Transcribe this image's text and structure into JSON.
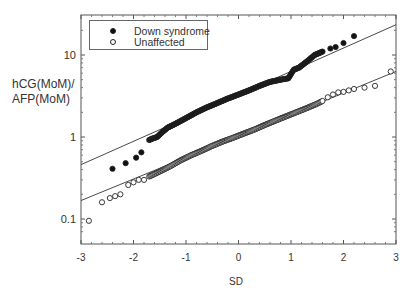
{
  "chart_data": {
    "type": "scatter",
    "title": "",
    "xlabel": "SD",
    "ylabel": "hCG(MoM)/ AFP(MoM)",
    "ylabel_lines": [
      "hCG(MoM)/",
      "AFP(MoM)"
    ],
    "xlim": [
      -3,
      3
    ],
    "ylim": [
      0.065,
      25
    ],
    "yscale": "log",
    "x_ticks": [
      -3,
      -2,
      -1,
      0,
      1,
      2,
      3
    ],
    "x_tick_labels": [
      "-3",
      "-2",
      "-1",
      "0",
      "1",
      "2",
      "3"
    ],
    "y_ticks": [
      0.1,
      1,
      10
    ],
    "y_tick_labels": [
      "0.1",
      "1",
      "10"
    ],
    "grid": false,
    "legend_position": "upper left",
    "legend": [
      {
        "label": "Down syndrome",
        "marker": "filled-circle"
      },
      {
        "label": "Unaffected",
        "marker": "open-circle"
      }
    ],
    "series": [
      {
        "name": "Down syndrome",
        "marker": "filled-circle",
        "fit_line": {
          "x": [
            -3,
            3
          ],
          "y": [
            0.46,
            23.4
          ]
        },
        "points": {
          "x": [
            -2.4,
            -2.15,
            -1.95,
            -1.85,
            -1.7,
            -1.65,
            -1.55,
            -1.45,
            -1.35,
            -1.2,
            -1.0,
            -0.8,
            -0.6,
            -0.4,
            -0.2,
            0.0,
            0.2,
            0.4,
            0.6,
            0.8,
            0.95,
            1.05,
            1.15,
            1.3,
            1.45,
            1.6,
            1.75,
            1.85,
            2.0,
            2.2
          ],
          "y": [
            0.41,
            0.48,
            0.56,
            0.65,
            0.92,
            0.95,
            1.0,
            1.15,
            1.3,
            1.45,
            1.7,
            2.0,
            2.3,
            2.6,
            2.95,
            3.3,
            3.7,
            4.2,
            4.7,
            5.0,
            5.2,
            6.6,
            7.0,
            8.3,
            10.0,
            11.0,
            12.0,
            12.5,
            14.0,
            17.0
          ]
        }
      },
      {
        "name": "Unaffected",
        "marker": "open-circle",
        "fit_line": {
          "x": [
            -3,
            3
          ],
          "y": [
            0.168,
            6.3
          ]
        },
        "points": {
          "x": [
            -2.85,
            -2.6,
            -2.45,
            -2.35,
            -2.25,
            -2.1,
            -2.0,
            -1.9,
            -1.8,
            -1.7,
            -1.5,
            -1.3,
            -1.1,
            -0.9,
            -0.7,
            -0.5,
            -0.3,
            -0.1,
            0.1,
            0.3,
            0.5,
            0.7,
            0.9,
            1.1,
            1.3,
            1.5,
            1.6,
            1.7,
            1.8,
            1.9,
            2.0,
            2.1,
            2.2,
            2.4,
            2.6,
            2.9
          ],
          "y": [
            0.095,
            0.16,
            0.18,
            0.19,
            0.2,
            0.26,
            0.28,
            0.3,
            0.3,
            0.33,
            0.38,
            0.44,
            0.52,
            0.6,
            0.68,
            0.78,
            0.88,
            0.98,
            1.1,
            1.23,
            1.4,
            1.58,
            1.78,
            2.0,
            2.25,
            2.55,
            2.75,
            3.05,
            3.3,
            3.5,
            3.55,
            3.7,
            3.85,
            4.0,
            4.2,
            6.3
          ]
        }
      }
    ]
  }
}
